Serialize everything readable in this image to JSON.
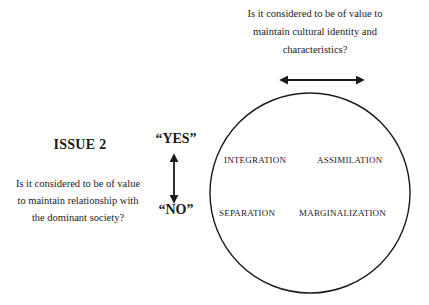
{
  "diagram": {
    "top_question": "Is it considered to be of value to maintain cultural identity and characteristics?",
    "issue_title": "ISSUE 2",
    "left_question": "Is it considered to be of value to maintain relationship with the dominant society?",
    "yes_label": "“YES”",
    "no_label": "“NO”",
    "quadrants": {
      "top_left": "INTEGRATION",
      "top_right": "ASSIMILATION",
      "bottom_left": "SEPARATION",
      "bottom_right": "MARGINALIZATION"
    },
    "arrows": {
      "horizontal": "double-headed-arrow",
      "vertical": "double-headed-arrow"
    },
    "colors": {
      "stroke": "#1a1a1a",
      "background": "#ffffff"
    }
  }
}
